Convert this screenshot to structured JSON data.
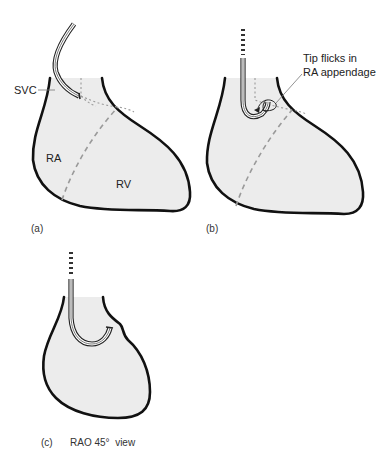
{
  "figure": {
    "panels": [
      {
        "id": "a",
        "caption": "(a)",
        "labels": {
          "svc": "SVC",
          "ra": "RA",
          "rv": "RV"
        }
      },
      {
        "id": "b",
        "caption": "(b)",
        "annotation_line1": "Tip flicks in",
        "annotation_line2": "RA appendage"
      },
      {
        "id": "c",
        "caption": "(c)",
        "view_label": "RAO 45°  view"
      }
    ],
    "colors": {
      "heart_fill": "#ececec",
      "outline": "#111111",
      "septum_dashes": "#9a9a9a"
    }
  }
}
